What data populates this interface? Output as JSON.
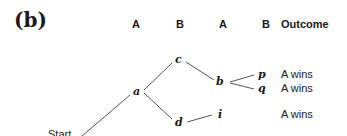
{
  "panel_label": "(b)",
  "headers": {
    "col1": "A",
    "col2": "B",
    "col3": "A",
    "col4": "B",
    "outcome": "Outcome"
  },
  "nodes": {
    "start": "Start",
    "a": "a",
    "c": "c",
    "d": "d",
    "b": "b",
    "i": "i",
    "p": "p",
    "q": "q"
  },
  "outcomes": {
    "p": "A wins",
    "q": "A wins",
    "i": "A wins"
  },
  "edges": [
    [
      "start",
      "a"
    ],
    [
      "a",
      "c"
    ],
    [
      "a",
      "d"
    ],
    [
      "c",
      "b"
    ],
    [
      "d",
      "i"
    ],
    [
      "b",
      "p"
    ],
    [
      "b",
      "q"
    ]
  ]
}
